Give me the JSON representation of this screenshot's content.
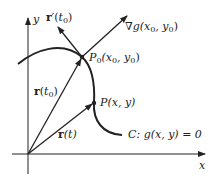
{
  "diagram": {
    "colors": {
      "ink": "#222222",
      "background": "#ffffff"
    },
    "axes": {
      "x_label": "x",
      "y_label": "y"
    },
    "curve": {
      "label_prefix": "C:",
      "equation": "g(x, y) = 0"
    },
    "points": {
      "p0": {
        "name": "P",
        "sub": "0",
        "coords": "(x",
        "coords_sub": "0",
        "coords_rest": ", y",
        "coords_sub2": "0",
        "coords_end": ")"
      },
      "p": {
        "label": "P(x, y)"
      }
    },
    "vectors": {
      "r_t0": {
        "bold": "r",
        "arg_open": "(",
        "arg": "t",
        "arg_sub": "0",
        "arg_close": ")"
      },
      "r_t": {
        "bold": "r",
        "arg": "(t)"
      },
      "r_prime_t0": {
        "bold": "r",
        "prime": "′",
        "arg_open": "(",
        "arg": "t",
        "arg_sub": "0",
        "arg_close": ")"
      },
      "grad_g": {
        "nabla": "∇",
        "fn": "g",
        "open": "(x",
        "sub1": "0",
        "mid": ", y",
        "sub2": "0",
        "close": ")"
      }
    }
  }
}
